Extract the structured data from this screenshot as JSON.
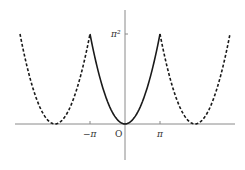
{
  "chart_data": {
    "type": "line",
    "title": "",
    "xlabel": "",
    "ylabel": "",
    "series": [
      {
        "name": "f(x)=x^2 on [-pi, pi]",
        "style": "solid",
        "x_range": [
          "-pi",
          "pi"
        ],
        "formula": "x^2"
      },
      {
        "name": "periodic extension left",
        "style": "dashed",
        "x_range": [
          "-3pi",
          "-pi"
        ],
        "formula": "(x+2pi)^2"
      },
      {
        "name": "periodic extension right",
        "style": "dashed",
        "x_range": [
          "pi",
          "3pi"
        ],
        "formula": "(x-2pi)^2"
      }
    ],
    "x_ticks": [
      "-π",
      "O",
      "π"
    ],
    "y_ticks": [
      "π²"
    ],
    "xlim": [
      "-3pi",
      "3pi"
    ],
    "ylim": [
      0,
      "pi^2"
    ],
    "grid": false,
    "legend": "none"
  },
  "labels": {
    "neg_pi": "−π",
    "origin": "O",
    "pi": "π",
    "pi_sq": "π²"
  },
  "colors": {
    "axis": "#8a8a8a",
    "curve": "#1a1a1a"
  }
}
